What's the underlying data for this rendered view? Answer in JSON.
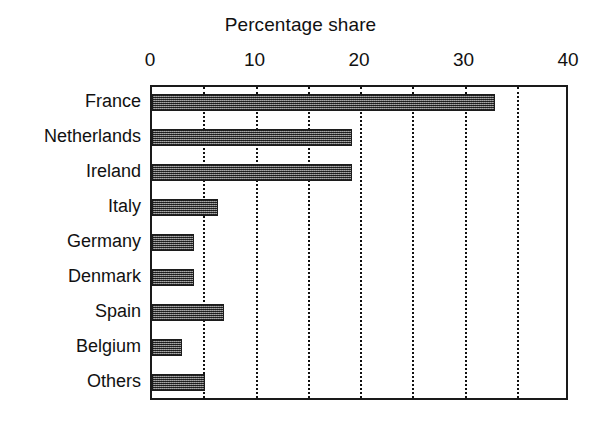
{
  "chart_data": {
    "type": "bar",
    "orientation": "horizontal",
    "title": "Percentage share",
    "xlabel": "",
    "ylabel": "",
    "categories": [
      "France",
      "Netherlands",
      "Ireland",
      "Italy",
      "Germany",
      "Denmark",
      "Spain",
      "Belgium",
      "Others"
    ],
    "values": [
      32.8,
      19.1,
      19.1,
      6.3,
      4.0,
      4.0,
      6.9,
      2.9,
      5.1
    ],
    "xlim": [
      0,
      40
    ],
    "xticks": [
      0,
      10,
      20,
      30,
      40
    ],
    "xtick_labels": [
      "0",
      "10",
      "20",
      "30",
      "40"
    ],
    "gridlines": [
      5,
      10,
      15,
      20,
      25,
      30,
      35
    ],
    "grid": true,
    "grid_style": "dotted",
    "legend": null,
    "bar_color": "#6f6f6f",
    "bar_edge_color": "#1c1c1c",
    "frame_color": "#1a1a1a",
    "background": "#ffffff"
  }
}
